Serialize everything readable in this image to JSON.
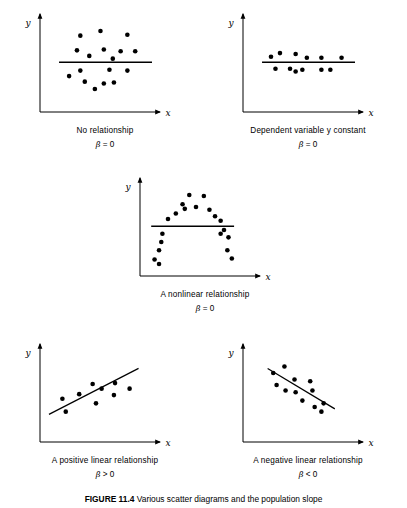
{
  "figure": {
    "caption_label": "FIGURE 11.4",
    "caption_text": "Various scatter diagrams and the population slope",
    "background_color": "#ffffff",
    "ink_color": "#000000"
  },
  "axis": {
    "x_label": "x",
    "y_label": "y"
  },
  "chart_data": [
    {
      "id": "no-relationship",
      "type": "scatter",
      "title": "No relationship",
      "beta": "β = 0",
      "xlabel": "x",
      "ylabel": "y",
      "xlim": [
        0,
        100
      ],
      "ylim": [
        0,
        100
      ],
      "grid": false,
      "legend": "none",
      "fit_line": {
        "kind": "horizontal",
        "x_start": 17,
        "x_end": 100,
        "y": 54
      },
      "points": [
        [
          36,
          83
        ],
        [
          54,
          88
        ],
        [
          78,
          84
        ],
        [
          33,
          67
        ],
        [
          57,
          68
        ],
        [
          72,
          66
        ],
        [
          85,
          66
        ],
        [
          44,
          61
        ],
        [
          65,
          58
        ],
        [
          36,
          45
        ],
        [
          62,
          46
        ],
        [
          78,
          45
        ],
        [
          26,
          39
        ],
        [
          40,
          33
        ],
        [
          57,
          31
        ],
        [
          66,
          32
        ],
        [
          49,
          25
        ]
      ]
    },
    {
      "id": "dependent-variable-constant",
      "type": "scatter",
      "title": "Dependent variable y constant",
      "beta": "β = 0",
      "xlabel": "x",
      "ylabel": "y",
      "xlim": [
        0,
        100
      ],
      "ylim": [
        0,
        100
      ],
      "grid": false,
      "legend": "none",
      "fit_line": {
        "kind": "horizontal",
        "x_start": 17,
        "x_end": 100,
        "y": 54
      },
      "points": [
        [
          25,
          60
        ],
        [
          33,
          64
        ],
        [
          47,
          63
        ],
        [
          57,
          59
        ],
        [
          70,
          59
        ],
        [
          88,
          59
        ],
        [
          29,
          47
        ],
        [
          42,
          47
        ],
        [
          47,
          44
        ],
        [
          53,
          46
        ],
        [
          70,
          46
        ],
        [
          78,
          46
        ]
      ]
    },
    {
      "id": "nonlinear-relationship",
      "type": "scatter",
      "title": "A nonlinear relationship",
      "beta": "β = 0",
      "xlabel": "x",
      "ylabel": "y",
      "xlim": [
        0,
        100
      ],
      "ylim": [
        0,
        100
      ],
      "grid": false,
      "legend": "none",
      "fit_line": {
        "kind": "horizontal",
        "x_start": 10,
        "x_end": 84,
        "y": 54
      },
      "points": [
        [
          13,
          18
        ],
        [
          17,
          13
        ],
        [
          17,
          28
        ],
        [
          19,
          37
        ],
        [
          20,
          46
        ],
        [
          25,
          62
        ],
        [
          32,
          68
        ],
        [
          38,
          78
        ],
        [
          40,
          73
        ],
        [
          44,
          88
        ],
        [
          50,
          75
        ],
        [
          57,
          87
        ],
        [
          62,
          72
        ],
        [
          67,
          65
        ],
        [
          72,
          60
        ],
        [
          75,
          50
        ],
        [
          72,
          46
        ],
        [
          79,
          42
        ],
        [
          78,
          28
        ],
        [
          82,
          19
        ]
      ]
    },
    {
      "id": "positive-linear-relationship",
      "type": "scatter",
      "title": "A positive linear relationship",
      "beta": "β > 0",
      "xlabel": "x",
      "ylabel": "y",
      "xlim": [
        0,
        100
      ],
      "ylim": [
        0,
        100
      ],
      "grid": false,
      "legend": "none",
      "fit_line": {
        "kind": "sloped",
        "x_start": 8,
        "y_start": 30,
        "x_end": 88,
        "y_end": 80
      },
      "points": [
        [
          20,
          47
        ],
        [
          23,
          33
        ],
        [
          35,
          52
        ],
        [
          47,
          63
        ],
        [
          55,
          58
        ],
        [
          50,
          42
        ],
        [
          67,
          64
        ],
        [
          66,
          51
        ],
        [
          80,
          58
        ]
      ]
    },
    {
      "id": "negative-linear-relationship",
      "type": "scatter",
      "title": "A negative linear relationship",
      "beta": "β < 0",
      "xlabel": "x",
      "ylabel": "y",
      "xlim": [
        0,
        100
      ],
      "ylim": [
        0,
        100
      ],
      "grid": false,
      "legend": "none",
      "fit_line": {
        "kind": "sloped",
        "x_start": 22,
        "y_start": 80,
        "x_end": 82,
        "y_end": 36
      },
      "points": [
        [
          27,
          75
        ],
        [
          37,
          82
        ],
        [
          30,
          62
        ],
        [
          46,
          68
        ],
        [
          60,
          66
        ],
        [
          38,
          56
        ],
        [
          47,
          54
        ],
        [
          62,
          56
        ],
        [
          53,
          45
        ],
        [
          72,
          42
        ],
        [
          64,
          38
        ],
        [
          70,
          33
        ]
      ]
    }
  ]
}
